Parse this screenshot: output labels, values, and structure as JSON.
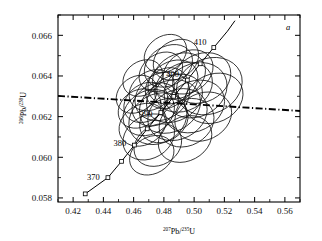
{
  "panel": {
    "label": "a"
  },
  "axes": {
    "x": {
      "name_pre": "207",
      "name_mid": "Pb/",
      "name_sup2": "235",
      "name_post": "U",
      "min": 0.41,
      "max": 0.57,
      "ticks": [
        0.42,
        0.44,
        0.46,
        0.48,
        0.5,
        0.52,
        0.54,
        0.56
      ],
      "ticklabels": [
        "0.42",
        "0.44",
        "0.46",
        "0.48",
        "0.50",
        "0.52",
        "0.54",
        "0.56"
      ],
      "minor_step": 0.01
    },
    "y": {
      "name_pre": "206",
      "name_mid": "Pb/",
      "name_sup2": "238",
      "name_post": "U",
      "min": 0.0578,
      "max": 0.067,
      "ticks": [
        0.058,
        0.06,
        0.062,
        0.064,
        0.066
      ],
      "ticklabels": [
        "0.058",
        "0.060",
        "0.062",
        "0.064",
        "0.066"
      ],
      "minor_step": 0.001
    }
  },
  "chart_data": {
    "type": "scatter",
    "title": "",
    "subtitle": "",
    "xlabel": "207Pb/235U",
    "ylabel": "206Pb/238U",
    "xlim": [
      0.41,
      0.57
    ],
    "ylim": [
      0.0578,
      0.067
    ],
    "grid": false,
    "legend": "none",
    "concordia": {
      "name": "Concordia curve",
      "age_unit": "Ma",
      "points": [
        {
          "age": 365,
          "x": 0.428,
          "y": 0.0582
        },
        {
          "age": 370,
          "x": 0.443,
          "y": 0.059
        },
        {
          "age": 375,
          "x": 0.452,
          "y": 0.0598
        },
        {
          "age": 380,
          "x": 0.4605,
          "y": 0.0606
        },
        {
          "age": 385,
          "x": 0.469,
          "y": 0.0614
        },
        {
          "age": 390,
          "x": 0.478,
          "y": 0.0622
        },
        {
          "age": 395,
          "x": 0.4865,
          "y": 0.063
        },
        {
          "age": 400,
          "x": 0.4955,
          "y": 0.0638
        },
        {
          "age": 405,
          "x": 0.504,
          "y": 0.0646
        },
        {
          "age": 410,
          "x": 0.513,
          "y": 0.0654
        },
        {
          "age": 415,
          "x": 0.522,
          "y": 0.0662
        },
        {
          "age": 418,
          "x": 0.527,
          "y": 0.06672
        }
      ],
      "marker_ages": [
        365,
        370,
        375,
        380,
        385,
        390,
        395,
        400,
        405,
        410
      ],
      "labeled_ages": [
        370,
        380,
        390,
        400,
        410
      ]
    },
    "discordia_line": {
      "name": "regression line",
      "style": "dash-dot",
      "x1": 0.41,
      "y1": 0.06302,
      "x2": 0.57,
      "y2": 0.06228
    },
    "ellipses": [
      {
        "cx": 0.47,
        "cy": 0.0622,
        "rx": 0.018,
        "ry": 0.00105,
        "rot": 32
      },
      {
        "cx": 0.4745,
        "cy": 0.0626,
        "rx": 0.0165,
        "ry": 0.00098,
        "rot": 34
      },
      {
        "cx": 0.479,
        "cy": 0.063,
        "rx": 0.019,
        "ry": 0.00112,
        "rot": 30
      },
      {
        "cx": 0.482,
        "cy": 0.0634,
        "rx": 0.015,
        "ry": 0.00095,
        "rot": 36
      },
      {
        "cx": 0.486,
        "cy": 0.0637,
        "rx": 0.0175,
        "ry": 0.001,
        "rot": 31
      },
      {
        "cx": 0.476,
        "cy": 0.0619,
        "rx": 0.02,
        "ry": 0.0012,
        "rot": 29
      },
      {
        "cx": 0.468,
        "cy": 0.0627,
        "rx": 0.0155,
        "ry": 0.0009,
        "rot": 35
      },
      {
        "cx": 0.49,
        "cy": 0.064,
        "rx": 0.0185,
        "ry": 0.00105,
        "rot": 30
      },
      {
        "cx": 0.493,
        "cy": 0.06345,
        "rx": 0.02,
        "ry": 0.00115,
        "rot": 28
      },
      {
        "cx": 0.484,
        "cy": 0.0625,
        "rx": 0.021,
        "ry": 0.00125,
        "rot": 27
      },
      {
        "cx": 0.48,
        "cy": 0.0618,
        "rx": 0.017,
        "ry": 0.001,
        "rot": 33
      },
      {
        "cx": 0.472,
        "cy": 0.0633,
        "rx": 0.016,
        "ry": 0.00092,
        "rot": 34
      },
      {
        "cx": 0.487,
        "cy": 0.0629,
        "rx": 0.0195,
        "ry": 0.0011,
        "rot": 29
      },
      {
        "cx": 0.466,
        "cy": 0.0616,
        "rx": 0.0165,
        "ry": 0.00098,
        "rot": 32
      },
      {
        "cx": 0.496,
        "cy": 0.0642,
        "rx": 0.0175,
        "ry": 0.001,
        "rot": 31
      },
      {
        "cx": 0.501,
        "cy": 0.0633,
        "rx": 0.0215,
        "ry": 0.0013,
        "rot": 26
      },
      {
        "cx": 0.489,
        "cy": 0.0621,
        "rx": 0.0205,
        "ry": 0.0012,
        "rot": 28
      },
      {
        "cx": 0.478,
        "cy": 0.0642,
        "rx": 0.0155,
        "ry": 0.00088,
        "rot": 35
      },
      {
        "cx": 0.464,
        "cy": 0.0624,
        "rx": 0.015,
        "ry": 0.0009,
        "rot": 33
      },
      {
        "cx": 0.505,
        "cy": 0.0639,
        "rx": 0.02,
        "ry": 0.00118,
        "rot": 27
      },
      {
        "cx": 0.495,
        "cy": 0.0617,
        "rx": 0.019,
        "ry": 0.00112,
        "rot": 29
      },
      {
        "cx": 0.47,
        "cy": 0.061,
        "rx": 0.018,
        "ry": 0.00105,
        "rot": 31
      },
      {
        "cx": 0.483,
        "cy": 0.0645,
        "rx": 0.017,
        "ry": 0.00095,
        "rot": 32
      },
      {
        "cx": 0.51,
        "cy": 0.0635,
        "rx": 0.0225,
        "ry": 0.00135,
        "rot": 25
      },
      {
        "cx": 0.462,
        "cy": 0.0631,
        "rx": 0.0145,
        "ry": 0.00085,
        "rot": 36
      },
      {
        "cx": 0.476,
        "cy": 0.0606,
        "rx": 0.0165,
        "ry": 0.00098,
        "rot": 30
      },
      {
        "cx": 0.5,
        "cy": 0.0625,
        "rx": 0.021,
        "ry": 0.00122,
        "rot": 27
      },
      {
        "cx": 0.488,
        "cy": 0.0648,
        "rx": 0.016,
        "ry": 0.00092,
        "rot": 33
      },
      {
        "cx": 0.472,
        "cy": 0.0601,
        "rx": 0.0155,
        "ry": 0.0009,
        "rot": 31
      },
      {
        "cx": 0.506,
        "cy": 0.062,
        "rx": 0.0195,
        "ry": 0.00115,
        "rot": 26
      },
      {
        "cx": 0.494,
        "cy": 0.0609,
        "rx": 0.0185,
        "ry": 0.00108,
        "rot": 28
      },
      {
        "cx": 0.481,
        "cy": 0.0651,
        "rx": 0.015,
        "ry": 0.00086,
        "rot": 34
      },
      {
        "cx": 0.466,
        "cy": 0.0639,
        "rx": 0.014,
        "ry": 0.00082,
        "rot": 35
      },
      {
        "cx": 0.513,
        "cy": 0.0629,
        "rx": 0.02,
        "ry": 0.00118,
        "rot": 25
      }
    ]
  },
  "age_labels": [
    {
      "text": "410",
      "age": 410
    },
    {
      "text": "400",
      "age": 400
    },
    {
      "text": "390",
      "age": 390
    },
    {
      "text": "380",
      "age": 380
    },
    {
      "text": "370",
      "age": 370
    }
  ],
  "colors": {
    "axis": "#000000",
    "ellipse": "#111111",
    "concordia": "#000000",
    "discordia": "#000000",
    "background": "#ffffff"
  }
}
